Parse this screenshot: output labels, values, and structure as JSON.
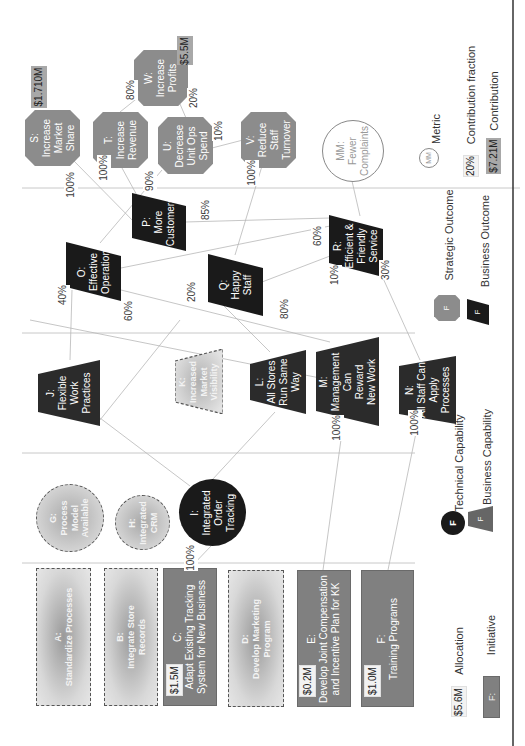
{
  "diagram": {
    "orientation": "rotated 90deg counter-clockwise",
    "colors": {
      "strategic_outcome": "#8c8c8c",
      "business_outcome": "#1a1a1a",
      "business_capability": "#2b2b2b",
      "technical_capability": "#1a1a1a",
      "initiative_funded": "#808080",
      "initiative_unfunded": "#d0d0d0",
      "contribution_label": "#a8a8a8",
      "divider": "#c8c8c8"
    },
    "strategic_outcomes": [
      {
        "id": "S",
        "label": "S:",
        "line1": "Increase",
        "line2": "Market",
        "line3": "Share",
        "contribution": "$1.710M"
      },
      {
        "id": "T",
        "label": "T:",
        "line1": "Increase",
        "line2": "Revenue",
        "line3": ""
      },
      {
        "id": "U",
        "label": "U:",
        "line1": "Decrease",
        "line2": "Unit Ops",
        "line3": "Spend"
      },
      {
        "id": "W",
        "label": "W:",
        "line1": "Increase",
        "line2": "Profits",
        "line3": "",
        "contribution": "$5.5M"
      },
      {
        "id": "V",
        "label": "V:",
        "line1": "Reduce",
        "line2": "Staff",
        "line3": "Turnover"
      }
    ],
    "metrics": [
      {
        "id": "MM",
        "label": "MM:",
        "line1": "Fewer",
        "line2": "Complaints"
      }
    ],
    "business_outcomes": [
      {
        "id": "P",
        "label": "P:",
        "line1": "More",
        "line2": "Customers"
      },
      {
        "id": "O",
        "label": "O:",
        "line1": "Effective",
        "line2": "Operation"
      },
      {
        "id": "Q",
        "label": "Q:",
        "line1": "Happy",
        "line2": "Staff"
      },
      {
        "id": "R",
        "label": "R:",
        "line1": "Efficient &",
        "line2": "Friendly",
        "line3": "Service"
      }
    ],
    "business_capabilities": [
      {
        "id": "J",
        "label": "J:",
        "line1": "Flexible",
        "line2": "Work",
        "line3": "Practices"
      },
      {
        "id": "K",
        "label": "K:",
        "line1": "Increased",
        "line2": "Market",
        "line3": "Visibility",
        "planned": true
      },
      {
        "id": "L",
        "label": "L:",
        "line1": "All Stores",
        "line2": "Run Same",
        "line3": "Way"
      },
      {
        "id": "M",
        "label": "M:",
        "line1": "Management",
        "line2": "Can",
        "line3": "Reward",
        "line4": "New Work"
      },
      {
        "id": "N",
        "label": "N:",
        "line1": "All Staff Can",
        "line2": "Apply",
        "line3": "Processes"
      }
    ],
    "technical_capabilities": [
      {
        "id": "G",
        "label": "G:",
        "line1": "Process",
        "line2": "Model",
        "line3": "Available",
        "planned": true
      },
      {
        "id": "H",
        "label": "H:",
        "line1": "Integrated",
        "line2": "CRM",
        "planned": true
      },
      {
        "id": "I",
        "label": "I:",
        "line1": "Integrated",
        "line2": "Order",
        "line3": "Tracking"
      }
    ],
    "initiatives": [
      {
        "id": "A",
        "label": "A:",
        "line1": "Standardize Processes",
        "line2": "",
        "planned": true
      },
      {
        "id": "B",
        "label": "B:",
        "line1": "Integrate Store",
        "line2": "Records",
        "planned": true
      },
      {
        "id": "C",
        "label": "C:",
        "line1": "Adapt Existing Tracking",
        "line2": "System for New Business",
        "allocation": "$1.5M"
      },
      {
        "id": "D",
        "label": "D:",
        "line1": "Develop Marketing",
        "line2": "Program",
        "planned": true
      },
      {
        "id": "E",
        "label": "E:",
        "line1": "Develop Joint Compensation",
        "line2": "and Incentive Plan for KK",
        "allocation": "$0.2M"
      },
      {
        "id": "F",
        "label": "F:",
        "line1": "Training Programs",
        "line2": "",
        "allocation": "$1.0M"
      }
    ],
    "contribution_fractions": {
      "S_to_P": "100%",
      "T_to_P": "100%",
      "T_to_W": "80%",
      "U_to_W": "20%",
      "U_to_O": "90%",
      "V_to_U": "10%",
      "V_to_Q": "100%",
      "P_from_R": "85%",
      "O_from_J": "40%",
      "O_from_M": "60%",
      "R_from_O": "60%",
      "R_from_Q": "10%",
      "R_from_N": "30%",
      "Q_from_L": "20%",
      "Q_from_M": "80%",
      "I_to_C": "100%",
      "M_from_E": "100%",
      "N_from_F": "100%"
    }
  },
  "legend": {
    "initiative": {
      "symbol": "F:",
      "label": "Initiative"
    },
    "allocation": {
      "symbol": "$5.6M",
      "label": "Allocation"
    },
    "technical_capability": {
      "symbol": "F",
      "label": "Technical Capability"
    },
    "business_capability": {
      "symbol": "F",
      "label": "Business Capability"
    },
    "strategic_outcome": {
      "symbol": "F",
      "label": "Strategic Outcome"
    },
    "business_outcome": {
      "symbol": "F",
      "label": "Business Outcome"
    },
    "metric": {
      "symbol": "MM",
      "label": "Metric"
    },
    "contribution_fraction": {
      "symbol": "20%",
      "label": "Contribution fraction"
    },
    "contribution": {
      "symbol": "$7.21M",
      "label": "Contribution"
    }
  }
}
